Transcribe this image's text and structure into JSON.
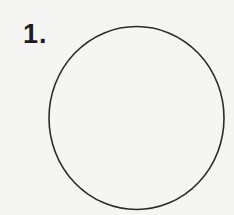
{
  "problem": {
    "number_label": "1.",
    "shape": {
      "type": "circle",
      "stroke_color": "#2a2a2a",
      "fill_color": "none"
    }
  },
  "colors": {
    "background": "#f5f5f3",
    "text": "#1e1e1e"
  }
}
